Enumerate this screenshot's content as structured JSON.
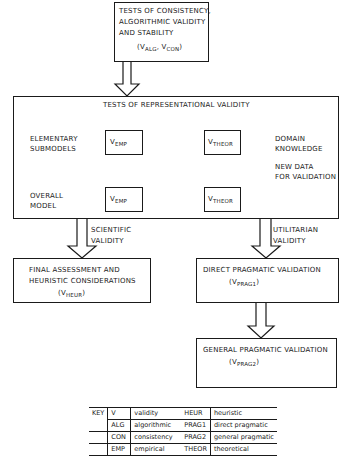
{
  "top_box": {
    "lines": [
      "TESTS OF CONSISTENCY,",
      "ALGORITHMIC VALIDITY",
      "AND STABILITY"
    ],
    "formula": {
      "open": "(V",
      "sub1": "ALG",
      "mid": ", V",
      "sub2": "CON",
      "close": ")"
    }
  },
  "representational": {
    "title": "TESTS OF REPRESENTATIONAL VALIDITY",
    "left_labels": {
      "elementary": [
        "ELEMENTARY",
        "SUBMODELS"
      ],
      "overall": [
        "OVERALL",
        "MODEL"
      ]
    },
    "right_labels": {
      "domain": [
        "DOMAIN",
        "KNOWLEDGE"
      ],
      "new_data": [
        "NEW DATA",
        "FOR VALIDATION"
      ]
    },
    "nodes": {
      "emp_v": "V",
      "emp_sub": "EMP",
      "theor_v": "V",
      "theor_sub": "THEOR"
    }
  },
  "arrows": {
    "scientific": [
      "SCIENTIFIC",
      "VALIDITY"
    ],
    "utilitarian": [
      "UTILITARIAN",
      "VALIDITY"
    ]
  },
  "final_box": {
    "lines": [
      "FINAL ASSESSMENT AND",
      "HEURISTIC CONSIDERATIONS"
    ],
    "formula": {
      "open": "(V",
      "sub": "HEUR",
      "close": ")"
    }
  },
  "direct_box": {
    "line": "DIRECT PRAGMATIC VALIDATION",
    "formula": {
      "open": "(V",
      "sub": "PRAG1",
      "close": ")"
    }
  },
  "general_box": {
    "line": "GENERAL PRAGMATIC VALIDATION",
    "formula": {
      "open": "(V",
      "sub": "PRAG2",
      "close": ")"
    }
  },
  "key": {
    "label": "KEY",
    "left": [
      {
        "code": "V",
        "meaning": "validity"
      },
      {
        "code": "ALG",
        "meaning": "algorithmic"
      },
      {
        "code": "CON",
        "meaning": "consistency"
      },
      {
        "code": "EMP",
        "meaning": "empirical"
      }
    ],
    "right": [
      {
        "code": "HEUR",
        "meaning": "heuristic"
      },
      {
        "code": "PRAG1",
        "meaning": "direct pragmatic"
      },
      {
        "code": "PRAG2",
        "meaning": "general pragmatic"
      },
      {
        "code": "THEOR",
        "meaning": "theoretical"
      }
    ]
  },
  "colors": {
    "ink": "#1a1a1a",
    "paper": "#ffffff"
  }
}
